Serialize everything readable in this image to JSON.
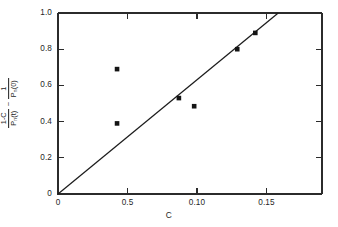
{
  "chart_data": {
    "type": "scatter",
    "title": "",
    "subtitle": "",
    "xlabel": "C",
    "ylabel_parts": {
      "term1_numerator": "1-C",
      "term1_denominator_base": "P",
      "term1_denominator_sub": "n",
      "term1_denominator_arg": "(t)",
      "operator": "−",
      "term2_numerator": "1",
      "term2_denominator_base": "P",
      "term2_denominator_sub": "n",
      "term2_denominator_arg": "(0)"
    },
    "ylabel_plain": "(1-C)/Pn(t) - 1/Pn(0)",
    "xlim": [
      0,
      0.19
    ],
    "ylim": [
      0,
      1.0
    ],
    "grid": false,
    "legend": "none",
    "x_ticks": [
      {
        "value": 0,
        "label": "0"
      },
      {
        "value": 0.05,
        "label": "0.5"
      },
      {
        "value": 0.1,
        "label": "0.10"
      },
      {
        "value": 0.15,
        "label": "0.15"
      }
    ],
    "y_ticks": [
      {
        "value": 0,
        "label": "0"
      },
      {
        "value": 0.2,
        "label": "0.2"
      },
      {
        "value": 0.4,
        "label": "0.4"
      },
      {
        "value": 0.6,
        "label": "0.6"
      },
      {
        "value": 0.8,
        "label": "0.8"
      },
      {
        "value": 1.0,
        "label": "1.0"
      }
    ],
    "series": [
      {
        "name": "measurements",
        "marker": "filled-square",
        "marker_color": "#141414",
        "points": [
          {
            "x": 0.0425,
            "y": 0.69
          },
          {
            "x": 0.0425,
            "y": 0.39
          },
          {
            "x": 0.087,
            "y": 0.53
          },
          {
            "x": 0.098,
            "y": 0.485
          },
          {
            "x": 0.129,
            "y": 0.8
          },
          {
            "x": 0.142,
            "y": 0.89
          }
        ]
      },
      {
        "name": "fit-line",
        "type": "line",
        "color": "#1c1c1c",
        "x_start": 0.0,
        "y_start": 0.0,
        "x_end": 0.1585,
        "y_end": 1.0,
        "slope": 6.31,
        "intercept": 0.0
      }
    ],
    "colors": {
      "axis": "#2b2b2b",
      "marker": "#141414",
      "line": "#1c1c1c",
      "background": "#ffffff"
    }
  }
}
